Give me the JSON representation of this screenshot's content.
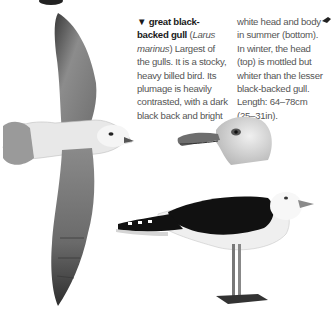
{
  "entry": {
    "marker": "▼",
    "common_name": "great black-backed gull",
    "scientific_name_open": " (",
    "scientific_name": "Larus marinus",
    "scientific_name_close": ")",
    "description_col1": "Largest of the gulls. It is a stocky, heavy billed bird. Its plumage is heavily contrasted, with a dark black back and bright",
    "description_col2": "white head and body in summer (bottom). In winter, the head (top) is mottled but whiter than the lesser black-backed gull. Length: 64–78cm (25–31in)."
  },
  "illustrations": {
    "flying": "Great black-backed gull in flight (from below)",
    "head": "Winter head, mottled",
    "standing": "Adult in summer plumage, standing"
  },
  "colors": {
    "text": "#555555",
    "heading": "#1a1a1a",
    "wing_grey": "#8a8a8a",
    "back_black": "#111111",
    "body_white": "#f2f2f2",
    "bill": "#9a9a9a"
  }
}
